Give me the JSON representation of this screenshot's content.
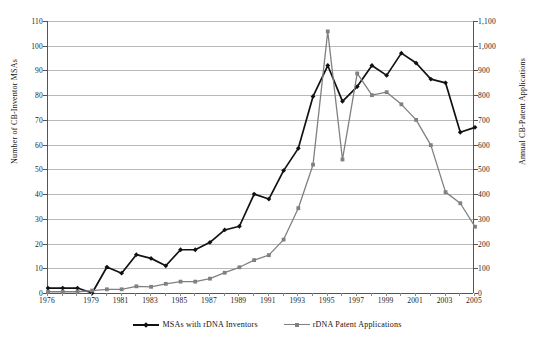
{
  "chart_data": {
    "type": "line",
    "title": "",
    "subtitle": "",
    "xlabel": "",
    "ylabel": "Number of CB-Inventor MSAs",
    "y2label": "Annual CB-Patent Applications",
    "grid": true,
    "legend_position": "bottom",
    "x": [
      1976,
      1977,
      1978,
      1979,
      1980,
      1981,
      1982,
      1983,
      1984,
      1985,
      1986,
      1987,
      1988,
      1989,
      1990,
      1991,
      1992,
      1993,
      1994,
      1995,
      1996,
      1997,
      1998,
      1999,
      2000,
      2001,
      2002,
      2003,
      2004,
      2005
    ],
    "xtick_labels": [
      "1976",
      "1979",
      "1981",
      "1983",
      "1985",
      "1987",
      "1989",
      "1991",
      "1993",
      "1995",
      "1997",
      "1999",
      "2001",
      "2003",
      "2005"
    ],
    "xtick_values": [
      1976,
      1979,
      1981,
      1983,
      1985,
      1987,
      1989,
      1991,
      1993,
      1995,
      1997,
      1999,
      2001,
      2003,
      2005
    ],
    "xlim": [
      1976,
      2005
    ],
    "ylim": [
      0,
      110
    ],
    "ytick_labels": [
      "0",
      "10",
      "20",
      "30",
      "40",
      "50",
      "60",
      "70",
      "80",
      "90",
      "100",
      "110"
    ],
    "ytick_values": [
      0,
      10,
      20,
      30,
      40,
      50,
      60,
      70,
      80,
      90,
      100,
      110
    ],
    "y2lim": [
      0,
      1100
    ],
    "y2tick_labels": [
      "0",
      "100",
      "200",
      "300",
      "400",
      "500",
      "600",
      "700",
      "800",
      "900",
      "1,000",
      "1,100"
    ],
    "y2tick_values": [
      0,
      100,
      200,
      300,
      400,
      500,
      600,
      700,
      800,
      900,
      1000,
      1100
    ],
    "series": [
      {
        "name": "MSAs with rDNA Inventors",
        "axis": "left",
        "color": "#111111",
        "marker": "diamond",
        "values": [
          2,
          2,
          2,
          0,
          10.5,
          8,
          15.5,
          14,
          11,
          17.5,
          17.5,
          20.5,
          25.5,
          27,
          40,
          38,
          49.5,
          58.5,
          79.5,
          92,
          77.5,
          83.5,
          92,
          88,
          97,
          93,
          86.5,
          85,
          65,
          67
        ]
      },
      {
        "name": "rDNA Patent Applications",
        "axis": "right",
        "color": "#808080",
        "marker": "square",
        "values": [
          5,
          5,
          5,
          10,
          15,
          15,
          27,
          25,
          37,
          46,
          46,
          58,
          82,
          104,
          133,
          153,
          216,
          343,
          519,
          1058,
          540,
          888,
          800,
          812,
          763,
          700,
          598,
          408,
          363,
          268
        ]
      }
    ]
  },
  "legend": {
    "entries": [
      {
        "label": "MSAs with rDNA Inventors",
        "color": "#111111",
        "marker": "diamond"
      },
      {
        "label": "rDNA Patent Applications",
        "color": "#808080",
        "marker": "square"
      }
    ]
  },
  "axes": {
    "left_title": "Number of CB-Inventor MSAs",
    "right_title": "Annual CB-Patent Applications"
  },
  "colors": {
    "series_black": "#111111",
    "series_gray": "#808080",
    "gridline": "#b9b9b9",
    "axis": "#555555",
    "background": "#ffffff"
  }
}
